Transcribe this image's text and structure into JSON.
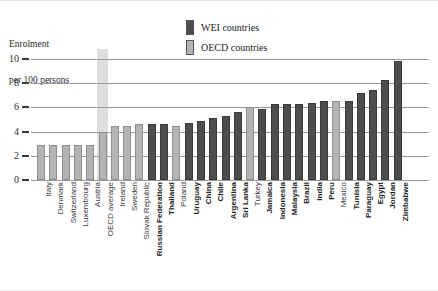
{
  "axis_title": {
    "line1": "Enrolment",
    "line2": "per 100 persons"
  },
  "legend": {
    "items": [
      {
        "label": "WEI countries",
        "color": "#4d4d4d",
        "key": "wei"
      },
      {
        "label": "OECD countries",
        "color": "#b4b4b4",
        "key": "oecd"
      }
    ]
  },
  "chart_data": {
    "type": "bar",
    "title": "",
    "subtitle": "",
    "xlabel": "",
    "ylabel": "Enrolment per 100 persons",
    "ylim": [
      0,
      10
    ],
    "yticks": [
      0,
      2,
      4,
      6,
      8,
      10
    ],
    "ytick_labels": [
      "0",
      "2",
      "4",
      "6",
      "8",
      "10"
    ],
    "grid": true,
    "legend_position": "top-right",
    "group_colors": {
      "wei": "#4d4d4d",
      "oecd": "#b4b4b4"
    },
    "highlight_category": "OECD average",
    "categories": [
      "Italy",
      "Denmark",
      "Switzerland",
      "Luxembourg",
      "Austria",
      "OECD average",
      "Ireland",
      "Sweden",
      "Slovak Republic",
      "Russian Federation",
      "Thailand",
      "Poland",
      "Uruguay",
      "China",
      "Chile",
      "Argentina",
      "Sri Lanka",
      "Turkey",
      "Jamaica",
      "Indonesia",
      "Malaysia",
      "Brazil",
      "India",
      "Peru",
      "Mexico",
      "Tunisia",
      "Paraguay",
      "Egypt",
      "Jordan",
      "Zimbabwe"
    ],
    "groups": [
      "oecd",
      "oecd",
      "oecd",
      "oecd",
      "oecd",
      "oecd",
      "oecd",
      "oecd",
      "oecd",
      "wei",
      "wei",
      "oecd",
      "wei",
      "wei",
      "wei",
      "wei",
      "wei",
      "oecd",
      "wei",
      "wei",
      "wei",
      "wei",
      "wei",
      "wei",
      "oecd",
      "wei",
      "wei",
      "wei",
      "wei",
      "wei"
    ],
    "values": [
      2.9,
      2.9,
      2.9,
      2.9,
      2.9,
      4.0,
      4.5,
      4.5,
      4.6,
      4.6,
      4.6,
      4.5,
      4.7,
      4.9,
      5.1,
      5.3,
      5.6,
      6.0,
      5.9,
      6.3,
      6.3,
      6.3,
      6.4,
      6.5,
      6.5,
      6.5,
      7.2,
      7.4,
      8.3,
      9.8
    ]
  }
}
